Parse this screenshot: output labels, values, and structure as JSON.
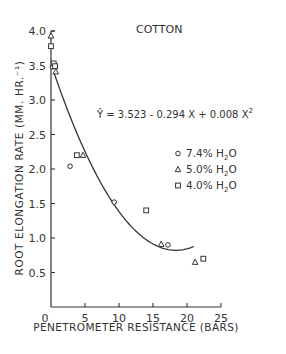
{
  "chart_data": {
    "type": "scatter",
    "title": "COTTON",
    "xlabel": "PENETROMETER RESISTANCE (BARS)",
    "ylabel": "ROOT ELONGATION RATE (MM. HR.⁻¹)",
    "xlim": [
      0,
      25
    ],
    "ylim": [
      0,
      4.0
    ],
    "x_ticks": [
      0,
      5,
      10,
      15,
      20,
      25
    ],
    "x_tick_labels": [
      "0",
      "5",
      "10",
      "15",
      "20",
      "25"
    ],
    "y_ticks": [
      0.5,
      1.0,
      1.5,
      2.0,
      2.5,
      3.0,
      3.5,
      4.0
    ],
    "y_tick_labels": [
      "0.5",
      "1.0",
      "1.5",
      "2.0",
      "2.5",
      "3.0",
      "3.5",
      "4.0"
    ],
    "grid": false,
    "legend_position": "right-center",
    "annotation": {
      "equation_prefix": "Ŷ = 3.523 - 0.294 X + 0.008 X",
      "equation_superscript": "2",
      "coefficients": {
        "intercept": 3.523,
        "linear": -0.294,
        "quadratic": 0.008
      }
    },
    "fit_curve": {
      "type": "quadratic",
      "x_range": [
        0.5,
        21
      ]
    },
    "series": [
      {
        "name": "7.4% H2O",
        "marker": "circle",
        "points": [
          [
            0.2,
            3.48
          ],
          [
            2.8,
            2.04
          ],
          [
            9.3,
            1.52
          ],
          [
            17.2,
            0.9
          ]
        ]
      },
      {
        "name": "5.0% H2O",
        "marker": "triangle",
        "points": [
          [
            0.0,
            3.93
          ],
          [
            0.7,
            3.41
          ],
          [
            4.7,
            2.2
          ],
          [
            16.2,
            0.91
          ],
          [
            21.2,
            0.65
          ]
        ]
      },
      {
        "name": "4.0% H2O",
        "marker": "square",
        "points": [
          [
            0.0,
            3.78
          ],
          [
            0.4,
            3.53
          ],
          [
            0.6,
            3.49
          ],
          [
            3.8,
            2.2
          ],
          [
            14.0,
            1.4
          ],
          [
            22.4,
            0.7
          ]
        ]
      }
    ]
  },
  "legend": [
    {
      "pct": "7.4%",
      "h": "H",
      "sub": "2",
      "o": "O",
      "marker": "circle"
    },
    {
      "pct": "5.0%",
      "h": "H",
      "sub": "2",
      "o": "O",
      "marker": "triangle"
    },
    {
      "pct": "4.0%",
      "h": "H",
      "sub": "2",
      "o": "O",
      "marker": "square"
    }
  ],
  "colors": {
    "ink": "#333333",
    "background": "#ffffff"
  }
}
